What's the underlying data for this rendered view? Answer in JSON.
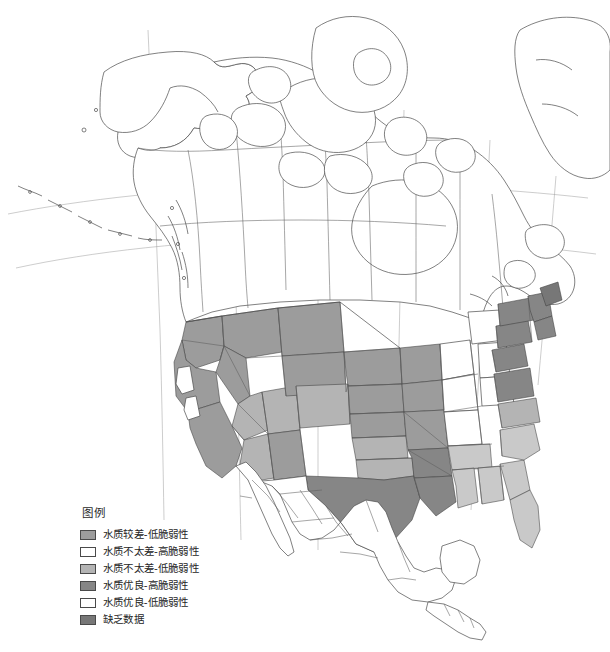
{
  "figure": {
    "type": "choropleth-map",
    "region": "North America",
    "background_color": "#ffffff",
    "border_color": "#4a4a4a",
    "graticule_color": "#8c8c8c"
  },
  "legend": {
    "title": "图例",
    "items": [
      {
        "label": "水质较差-低脆弱性",
        "color": "#9c9c9c"
      },
      {
        "label": "水质不太差-高脆弱性",
        "color": "#ffffff"
      },
      {
        "label": "水质不太差-低脆弱性",
        "color": "#b4b4b4"
      },
      {
        "label": "水质优良-高脆弱性",
        "color": "#868686"
      },
      {
        "label": "水质优良-低脆弱性",
        "color": "#ffffff"
      },
      {
        "label": "缺乏数据",
        "color": "#777777"
      }
    ]
  },
  "map_regions": [
    {
      "name": "Alaska",
      "class": "no-data-white"
    },
    {
      "name": "Canada",
      "class": "no-data-white"
    },
    {
      "name": "Mexico",
      "class": "no-data-white"
    },
    {
      "name": "Central America",
      "class": "no-data-white"
    },
    {
      "name": "Greenland",
      "class": "no-data-white"
    },
    {
      "name": "Western United States",
      "class": "shaded-medium"
    },
    {
      "name": "Great Plains",
      "class": "shaded-medium"
    },
    {
      "name": "Texas",
      "class": "shaded-dark"
    },
    {
      "name": "Northeast United States",
      "class": "shaded-dark"
    },
    {
      "name": "Southeast United States",
      "class": "shaded-light"
    },
    {
      "name": "Great Lakes States",
      "class": "no-data-white"
    }
  ]
}
